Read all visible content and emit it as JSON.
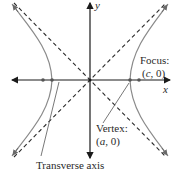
{
  "diagram": {
    "type": "hyperbola",
    "axes": {
      "x_label": "x",
      "y_label": "y"
    },
    "labels": {
      "focus_title": "Focus:",
      "focus_coord_var": "c",
      "focus_coord_rest": ", 0)",
      "focus_coord_open": "(",
      "vertex_title": "Vertex:",
      "vertex_coord_open": "(",
      "vertex_coord_var": "a",
      "vertex_coord_rest": ", 0)",
      "transverse_axis": "Transverse axis"
    },
    "colors": {
      "curve": "#8a8a8a",
      "axis": "#1a1a1a",
      "asymptote": "#2a2a2a",
      "text": "#2a2a2a"
    }
  }
}
